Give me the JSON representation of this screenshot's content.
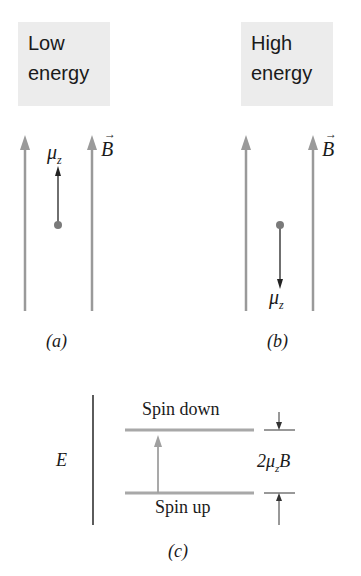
{
  "panel_a": {
    "title_line1": "Low",
    "title_line2": "energy",
    "moment_label": "μ",
    "moment_sub": "z",
    "field_label": "B",
    "caption": "(a)"
  },
  "panel_b": {
    "title_line1": "High",
    "title_line2": "energy",
    "moment_label": "μ",
    "moment_sub": "z",
    "field_label": "B",
    "caption": "(b)"
  },
  "panel_c": {
    "axis_label": "E",
    "upper_level": "Spin down",
    "lower_level": "Spin up",
    "gap_prefix": "2μ",
    "gap_sub": "z",
    "gap_suffix": "B",
    "caption": "(c)"
  },
  "colors": {
    "field_line": "#9a9a9a",
    "moment": "#222222",
    "dot": "#7a7a7a",
    "level": "#a8a8a8",
    "box_bg": "#ececec"
  }
}
